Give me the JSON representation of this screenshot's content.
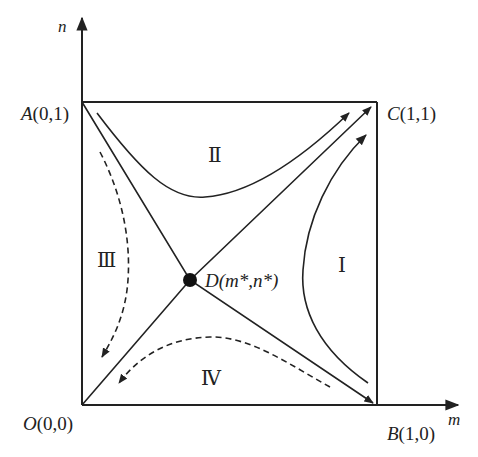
{
  "axes": {
    "x_label": "m",
    "y_label": "n"
  },
  "points": {
    "O": {
      "name": "O",
      "coords": "(0,0)"
    },
    "A": {
      "name": "A",
      "coords": "(0,1)"
    },
    "B": {
      "name": "B",
      "coords": "(1,0)"
    },
    "C": {
      "name": "C",
      "coords": "(1,1)"
    },
    "D": {
      "name": "D",
      "coords": "(m*,n*)"
    }
  },
  "regions": {
    "I": "Ⅰ",
    "II": "Ⅱ",
    "III": "Ⅲ",
    "IV": "Ⅳ"
  },
  "colors": {
    "line": "#222222",
    "background": "#ffffff"
  }
}
